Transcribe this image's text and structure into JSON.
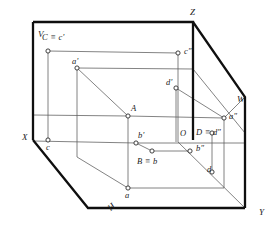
{
  "diagram": {
    "type": "descriptive-geometry-projection",
    "colors": {
      "frame_stroke": "#111111",
      "line_stroke": "#555555",
      "point_stroke": "#333333",
      "point_fill": "#ffffff",
      "background": "#ffffff",
      "label_color": "#1a1a1a"
    },
    "axes": [
      {
        "name": "X",
        "label": "X",
        "x": 22,
        "y": 133
      },
      {
        "name": "Y",
        "label": "Y",
        "x": 259,
        "y": 208
      },
      {
        "name": "Z",
        "label": "Z",
        "x": 190,
        "y": 8
      }
    ],
    "planes": [
      {
        "name": "V",
        "label": "V",
        "x": 38,
        "y": 30,
        "desc": "vertical projection plane"
      },
      {
        "name": "W",
        "label": "W",
        "x": 237,
        "y": 95,
        "desc": "profile projection plane"
      },
      {
        "name": "H",
        "label": "H",
        "x": 106,
        "y": 206,
        "desc": "horizontal projection plane"
      }
    ],
    "points": [
      {
        "id": "Cc1",
        "label": "C ≡ c'",
        "lx": 42,
        "ly": 33,
        "px": 48,
        "py": 51
      },
      {
        "id": "c2",
        "label": "c″",
        "lx": 184,
        "ly": 47,
        "px": 178,
        "py": 53
      },
      {
        "id": "a1",
        "label": "a'",
        "lx": 72,
        "ly": 57,
        "px": 77,
        "py": 68
      },
      {
        "id": "d1",
        "label": "d'",
        "lx": 168,
        "ly": 79,
        "px": 176,
        "py": 88
      },
      {
        "id": "A",
        "label": "A",
        "lx": 131,
        "ly": 104,
        "px": 128,
        "py": 116
      },
      {
        "id": "a2",
        "label": "a″",
        "lx": 230,
        "ly": 112,
        "px": 224,
        "py": 118
      },
      {
        "id": "b1",
        "label": "b'",
        "lx": 139,
        "ly": 132,
        "px": 136,
        "py": 143
      },
      {
        "id": "O",
        "label": "O",
        "lx": 180,
        "ly": 129,
        "px": 178,
        "py": 142
      },
      {
        "id": "Dd2",
        "label": "D ≡ d″",
        "lx": 197,
        "ly": 129,
        "px": 0,
        "py": 0
      },
      {
        "id": "b2",
        "label": "b″",
        "lx": 197,
        "ly": 143,
        "px": 190,
        "py": 151
      },
      {
        "id": "Bb",
        "label": "B ≡ b",
        "lx": 138,
        "ly": 156,
        "px": 152,
        "py": 151
      },
      {
        "id": "c",
        "label": "c",
        "lx": 47,
        "ly": 143,
        "px": 48,
        "py": 140
      },
      {
        "id": "d",
        "label": "d",
        "lx": 208,
        "ly": 166,
        "px": 212,
        "py": 172
      },
      {
        "id": "a",
        "label": "a",
        "lx": 125,
        "ly": 192,
        "px": 128,
        "py": 188
      }
    ],
    "frame": {
      "v_plane_outline": "33,22 193,22 193,140 33,140",
      "w_plane_outline": "193,22 245,97 245,208 193,140",
      "h_plane_outline": "33,140 193,140 245,208 88,208"
    }
  }
}
